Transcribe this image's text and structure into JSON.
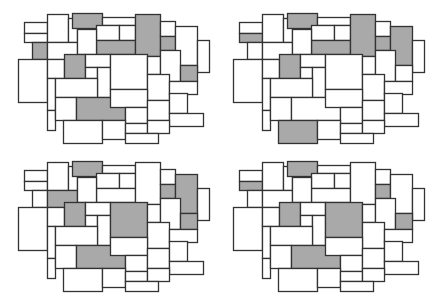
{
  "diagram": {
    "colors": {
      "fill": "#ffffff",
      "highlight": "#a9a9a9",
      "stroke": "#333333"
    },
    "base_rects": [
      [
        24,
        22,
        23,
        11
      ],
      [
        24,
        33,
        23,
        9
      ],
      [
        47,
        14,
        21,
        28
      ],
      [
        68,
        18,
        9,
        24
      ],
      [
        72,
        13,
        30,
        15
      ],
      [
        102,
        17,
        33,
        8
      ],
      [
        96,
        25,
        23,
        15
      ],
      [
        119,
        25,
        16,
        15
      ],
      [
        96,
        40,
        39,
        14
      ],
      [
        135,
        14,
        25,
        42
      ],
      [
        160,
        21,
        15,
        15
      ],
      [
        160,
        36,
        15,
        14
      ],
      [
        175,
        26,
        22,
        39
      ],
      [
        197,
        40,
        12,
        32
      ],
      [
        32,
        42,
        15,
        17
      ],
      [
        47,
        42,
        30,
        17
      ],
      [
        77,
        29,
        19,
        25
      ],
      [
        18,
        59,
        29,
        43
      ],
      [
        47,
        59,
        17,
        19
      ],
      [
        64,
        54,
        21,
        24
      ],
      [
        85,
        54,
        25,
        13
      ],
      [
        85,
        67,
        12,
        11
      ],
      [
        97,
        67,
        13,
        30
      ],
      [
        110,
        54,
        37,
        35
      ],
      [
        147,
        56,
        13,
        18
      ],
      [
        160,
        50,
        20,
        31
      ],
      [
        180,
        65,
        17,
        16
      ],
      [
        147,
        74,
        22,
        26
      ],
      [
        169,
        81,
        28,
        13
      ],
      [
        47,
        78,
        8,
        32
      ],
      [
        47,
        110,
        8,
        20
      ],
      [
        55,
        78,
        42,
        19
      ],
      [
        55,
        97,
        21,
        23
      ],
      [
        76,
        97,
        49,
        23
      ],
      [
        110,
        89,
        37,
        18
      ],
      [
        125,
        107,
        22,
        16
      ],
      [
        147,
        100,
        22,
        20
      ],
      [
        169,
        93,
        18,
        20
      ],
      [
        169,
        113,
        34,
        13
      ],
      [
        63,
        120,
        39,
        23
      ],
      [
        102,
        120,
        23,
        19
      ],
      [
        125,
        123,
        22,
        10
      ],
      [
        147,
        120,
        22,
        13
      ],
      [
        125,
        133,
        33,
        10
      ]
    ],
    "panels": [
      {
        "id": "top-left",
        "offset": [
          0,
          0
        ],
        "highlighted": [
          4,
          8,
          9,
          11,
          14,
          19,
          26,
          33
        ]
      },
      {
        "id": "top-right",
        "offset": [
          215,
          0
        ],
        "highlighted": [
          1,
          4,
          8,
          9,
          11,
          12,
          19,
          39
        ]
      },
      {
        "id": "bottom-left",
        "offset": [
          0,
          148
        ],
        "highlighted": [
          4,
          11,
          12,
          15,
          19,
          23,
          26,
          33
        ]
      },
      {
        "id": "bottom-right",
        "offset": [
          215,
          148
        ],
        "highlighted": [
          1,
          4,
          11,
          19,
          23,
          26,
          33
        ]
      }
    ]
  }
}
